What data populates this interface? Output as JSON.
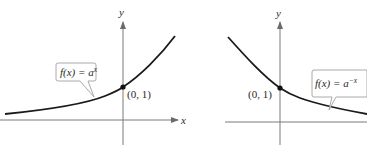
{
  "figure": {
    "left_graph": {
      "function_label": "f(x) = a",
      "exponent": "x",
      "point_label": "(0, 1)",
      "x_axis_label": "x",
      "y_axis_label": "y"
    },
    "right_graph": {
      "function_label": "f(x) = a",
      "exponent": "−x",
      "point_label": "(0, 1)",
      "y_axis_label": "y"
    },
    "colors": {
      "curve": "#1a1a1a",
      "axes": "#6b6b6b",
      "callout_border": "#9a9a9a",
      "point": "#111111"
    }
  }
}
